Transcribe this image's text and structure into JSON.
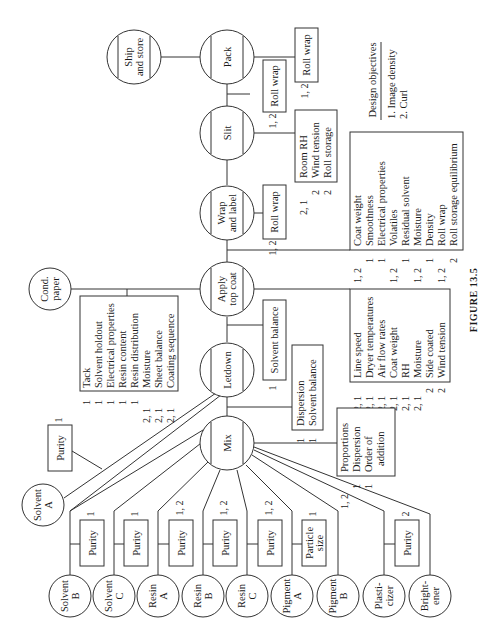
{
  "figure": {
    "caption": "FIGURE 13.5",
    "orientation": "rotated 90° counterclockwise",
    "design_objectives": {
      "title": "Design objectives",
      "items": [
        "1.  Image density",
        "2.  Curl"
      ]
    },
    "main_chain": [
      {
        "id": "ship",
        "line1": "Ship",
        "line2": "and store"
      },
      {
        "id": "pack",
        "line1": "Pack",
        "line2": ""
      },
      {
        "id": "slit",
        "line1": "Slit",
        "line2": ""
      },
      {
        "id": "wrap",
        "line1": "Wrap",
        "line2": "and label"
      },
      {
        "id": "apply",
        "line1": "Apply",
        "line2": "top coat"
      },
      {
        "id": "letdown",
        "line1": "Letdown",
        "line2": ""
      },
      {
        "id": "mix",
        "line1": "Mix",
        "line2": ""
      }
    ],
    "cond_paper": {
      "line1": "Cond.",
      "line2": "paper"
    },
    "pack_box": {
      "codes": "1, 2",
      "items": [
        "Roll wrap"
      ]
    },
    "slit_box_top": {
      "codes": "1, 2",
      "items": [
        "Roll wrap"
      ]
    },
    "slit_box": {
      "codes": [
        "2, 1",
        "2",
        "2"
      ],
      "items": [
        "Room RH",
        "Wind tension",
        "Roll storage"
      ]
    },
    "wrap_box": {
      "codes": "1, 2",
      "items": [
        "Roll wrap"
      ]
    },
    "apply_box": {
      "codes": [
        "1, 2",
        "1",
        "1",
        "1, 2",
        "1",
        "1, 2",
        "1",
        "1, 2",
        "2"
      ],
      "items": [
        "Coat weight",
        "Smoothness",
        "Electrical properties",
        "Volatiles",
        "Residual solvent",
        "Moisture",
        "Density",
        "Roll wrap",
        "Roll storage equilibrium"
      ]
    },
    "cond_box": {
      "codes": [
        "1",
        "1",
        "1",
        "1",
        "1",
        "2, 1",
        "2, 1",
        "2, 1"
      ],
      "items": [
        "Tack",
        "Solvent holdout",
        "Electrical properties",
        "Resin content",
        "Resin distribution",
        "Moisture",
        "Sheet balance",
        "Coating sequence"
      ]
    },
    "letdown_box_top": {
      "codes": "1",
      "items": [
        "Solvent balance"
      ]
    },
    "letdown_box": {
      "codes": [
        "1",
        "1"
      ],
      "items": [
        "Dispersion",
        "Solvent balance"
      ]
    },
    "process_box": {
      "codes": [
        "2, 1",
        "2, 1",
        "2, 1",
        "2, 1",
        "2, 1",
        "2, 1",
        "2",
        "2"
      ],
      "items": [
        "Line speed",
        "Dryer temperatures",
        "Air flow rates",
        "Coat weight",
        "RH",
        "Moisture",
        "Side coated",
        "Wind tension"
      ]
    },
    "mix_box": {
      "codes": [
        "1, 2",
        "1",
        "1",
        ""
      ],
      "items": [
        "Proportions",
        "Dispersion",
        "Order of",
        "   addition"
      ]
    },
    "raw_materials": [
      {
        "id": "solvent-a",
        "line1": "Solvent",
        "line2": "A",
        "box": "Purity",
        "code": "1"
      },
      {
        "id": "solvent-b",
        "line1": "Solvent",
        "line2": "B",
        "box": "Purity",
        "code": "1"
      },
      {
        "id": "solvent-c",
        "line1": "Solvent",
        "line2": "C",
        "box": "Purity",
        "code": "1"
      },
      {
        "id": "resin-a",
        "line1": "Resin",
        "line2": "A",
        "box": "Purity",
        "code": "1, 2"
      },
      {
        "id": "resin-b",
        "line1": "Resin",
        "line2": "B",
        "box": "Purity",
        "code": "1, 2"
      },
      {
        "id": "resin-c",
        "line1": "Resin",
        "line2": "C",
        "box": "Purity",
        "code": "1, 2"
      },
      {
        "id": "pigment-a",
        "line1": "Pigment",
        "line2": "A",
        "box": "Particle size",
        "box_line1": "Particle",
        "box_line2": "size",
        "code": "1"
      },
      {
        "id": "pigment-b",
        "line1": "Pigment",
        "line2": "B",
        "box": "",
        "code": ""
      },
      {
        "id": "plasticizer",
        "line1": "Plasti-",
        "line2": "cizer",
        "box": "Purity",
        "code": "2"
      },
      {
        "id": "brightener",
        "line1": "Bright-",
        "line2": "ener",
        "box": "",
        "code": ""
      }
    ]
  }
}
